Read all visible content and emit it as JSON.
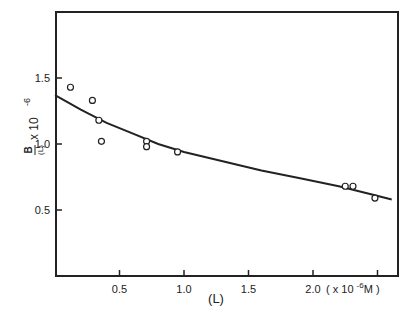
{
  "chart_data": {
    "type": "scatter",
    "title": "",
    "xlabel": "(L)",
    "x_unit_label": "( x 10 -6 M )",
    "ylabel": "B/(L) x 10^-6",
    "ylabel_parts": {
      "numerator": "B",
      "denominator": "(L)",
      "multiplier": "x 10",
      "exponent": "-6"
    },
    "xlim": [
      0,
      2.65
    ],
    "ylim": [
      0,
      2.0
    ],
    "x_ticks": [
      0.5,
      1.0,
      1.5,
      2.0,
      2.5
    ],
    "x_tick_labels": [
      "0.5",
      "1.0",
      "1.5",
      "2.0"
    ],
    "y_ticks": [
      0.5,
      1.0,
      1.5
    ],
    "y_tick_labels": [
      "0.5",
      "1.0",
      "1.5"
    ],
    "grid": false,
    "legend": null,
    "series": [
      {
        "name": "data",
        "marker": "open-circle",
        "x": [
          0.12,
          0.29,
          0.34,
          0.36,
          0.71,
          0.71,
          0.95,
          2.25,
          2.31,
          2.48
        ],
        "y": [
          1.43,
          1.33,
          1.18,
          1.02,
          1.02,
          0.98,
          0.94,
          0.68,
          0.68,
          0.59
        ]
      },
      {
        "name": "fitted curve",
        "marker": "line",
        "x": [
          0.0,
          0.2,
          0.4,
          0.6,
          0.8,
          1.0,
          1.3,
          1.6,
          1.9,
          2.2,
          2.45,
          2.61
        ],
        "y": [
          1.37,
          1.26,
          1.16,
          1.08,
          1.0,
          0.94,
          0.87,
          0.8,
          0.74,
          0.68,
          0.62,
          0.58
        ]
      }
    ]
  }
}
